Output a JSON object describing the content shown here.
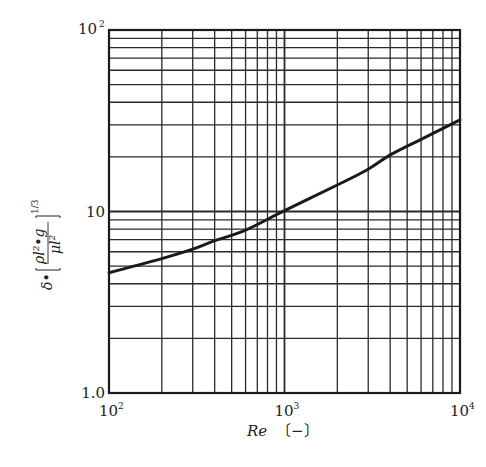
{
  "chart_data": {
    "type": "line",
    "title": "",
    "xlabel": "Re",
    "xlabel_unit": "〔−〕",
    "ylabel": "δ·[ρ_l²·g / μ_l²]^(1/3)",
    "ylabel_parts": {
      "prefix": "δ•",
      "numerator": "ρl²•g",
      "denominator": "μl²",
      "exponent": "1/3"
    },
    "xscale": "log",
    "yscale": "log",
    "xlim": [
      100,
      10000
    ],
    "ylim": [
      1.0,
      100
    ],
    "grid": true,
    "grid_minor": true,
    "legend": null,
    "x_ticks": [
      {
        "value": 100,
        "base": "10",
        "exp": "2"
      },
      {
        "value": 1000,
        "base": "10",
        "exp": "3"
      },
      {
        "value": 10000,
        "base": "10",
        "exp": "4"
      }
    ],
    "y_ticks": [
      {
        "value": 1,
        "label": "1.0",
        "exp": ""
      },
      {
        "value": 10,
        "label": "10",
        "exp": ""
      },
      {
        "value": 100,
        "label": "10",
        "exp": "2"
      }
    ],
    "series": [
      {
        "name": "film thickness correlation",
        "x": [
          100,
          200,
          300,
          400,
          600,
          1000,
          2000,
          3000,
          4000,
          6000,
          10000
        ],
        "y": [
          4.6,
          5.5,
          6.2,
          6.9,
          7.9,
          10.1,
          14.0,
          17.1,
          20.5,
          25.0,
          32.0
        ]
      }
    ]
  },
  "style": {
    "line_color": "#1a1a1a",
    "grid_color": "#2a2a2a",
    "background": "#ffffff"
  }
}
